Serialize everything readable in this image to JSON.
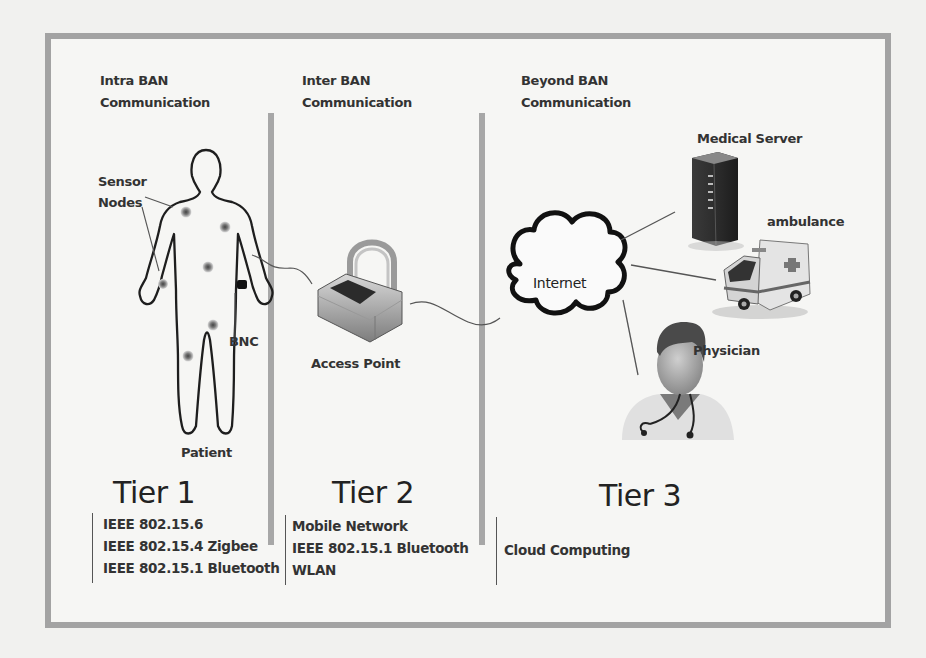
{
  "diagram": {
    "columns": [
      {
        "header": [
          "Intra BAN",
          "Communication"
        ],
        "tier": "Tier 1",
        "standards": [
          "IEEE 802.15.6",
          "IEEE 802.15.4 Zigbee",
          "IEEE 802.15.1 Bluetooth"
        ]
      },
      {
        "header": [
          "Inter BAN",
          "Communication"
        ],
        "tier": "Tier 2",
        "standards": [
          "Mobile Network",
          "IEEE 802.15.1 Bluetooth",
          "WLAN"
        ]
      },
      {
        "header": [
          "Beyond BAN",
          "Communication"
        ],
        "tier": "Tier 3",
        "standards": [
          "Cloud Computing"
        ]
      }
    ],
    "labels": {
      "sensor_nodes": [
        "Sensor",
        "Nodes"
      ],
      "bnc": "BNC",
      "patient": "Patient",
      "access_point": "Access Point",
      "internet": "Internet",
      "medical_server": "Medical Server",
      "ambulance": "ambulance",
      "physician": "Physician"
    },
    "colors": {
      "frame": "#a3a3a3",
      "background": "#f6f6f4",
      "text": "#333333"
    }
  }
}
